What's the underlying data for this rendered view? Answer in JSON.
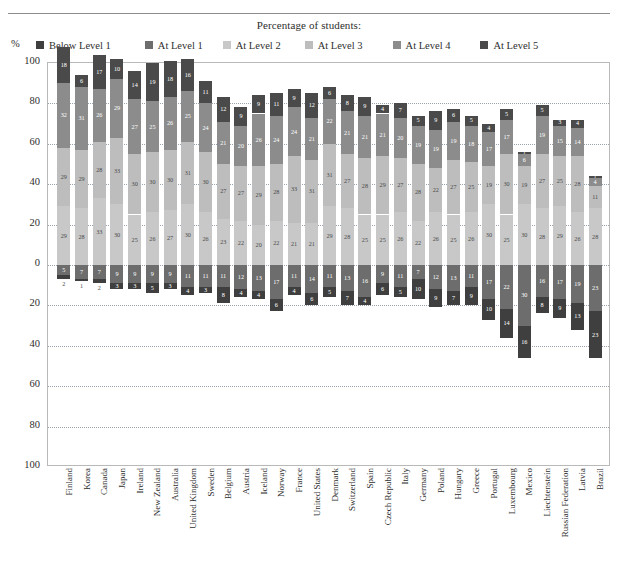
{
  "legend": {
    "title": "Percentage of students:",
    "axis_unit": "%",
    "items": [
      {
        "label": "Below Level 1",
        "color": "#3f3f3f"
      },
      {
        "label": "At Level 1",
        "color": "#6d6d6d"
      },
      {
        "label": "At Level 2",
        "color": "#c8c8c8"
      },
      {
        "label": "At Level 3",
        "color": "#bdbdbd"
      },
      {
        "label": "At Level 4",
        "color": "#8c8c8c"
      },
      {
        "label": "At Level 5",
        "color": "#4a4a4a"
      }
    ]
  },
  "yaxis": {
    "ticks_top": [
      "100",
      "80",
      "60",
      "40",
      "20",
      "0"
    ],
    "ticks_bottom": [
      "20",
      "40",
      "60",
      "80",
      "100"
    ],
    "all_ticks": [
      "100",
      "80",
      "60",
      "40",
      "20",
      "0",
      "20",
      "40",
      "60",
      "80",
      "100"
    ]
  },
  "chart_data": {
    "type": "bar",
    "subtype": "diverging-stacked-bar",
    "title": "Percentage of students:",
    "xlabel": "",
    "ylabel": "%",
    "ylim": [
      -100,
      100
    ],
    "grid": true,
    "legend_position": "top",
    "baseline_note": "Levels 2 and above plotted upward from the 0 line; Level 1 and Below Level 1 plotted downward.",
    "categories": [
      "Finland",
      "Korea",
      "Canada",
      "Japan",
      "Ireland",
      "New Zealand",
      "Australia",
      "United Kingdom",
      "Sweden",
      "Belgium",
      "Austria",
      "Iceland",
      "Norway",
      "France",
      "United States",
      "Denmark",
      "Switzerland",
      "Spain",
      "Czech Republic",
      "Italy",
      "Germany",
      "Poland",
      "Hungary",
      "Greece",
      "Portugal",
      "Luxembourg",
      "Mexico",
      "Liechtenstein",
      "Russian Federation",
      "Latvia",
      "Brazil"
    ],
    "series": [
      {
        "name": "At Level 5",
        "color": "#4a4a4a",
        "direction": "up",
        "values": [
          18,
          6,
          17,
          10,
          14,
          19,
          18,
          16,
          11,
          12,
          9,
          9,
          11,
          9,
          12,
          6,
          8,
          9,
          4,
          7,
          5,
          9,
          6,
          5,
          4,
          5,
          1,
          5,
          3,
          4,
          1
        ]
      },
      {
        "name": "At Level 4",
        "color": "#8c8c8c",
        "direction": "up",
        "values": [
          32,
          31,
          26,
          29,
          27,
          25,
          26,
          25,
          24,
          21,
          20,
          26,
          24,
          24,
          21,
          22,
          21,
          21,
          21,
          20,
          19,
          19,
          19,
          18,
          17,
          17,
          6,
          19,
          15,
          14,
          4
        ]
      },
      {
        "name": "At Level 3",
        "color": "#bdbdbd",
        "direction": "up",
        "values": [
          29,
          29,
          28,
          33,
          30,
          30,
          30,
          31,
          30,
          27,
          27,
          29,
          28,
          33,
          31,
          31,
          27,
          28,
          29,
          27,
          28,
          22,
          27,
          25,
          19,
          30,
          19,
          27,
          25,
          28,
          11
        ]
      },
      {
        "name": "At Level 2",
        "color": "#c8c8c8",
        "direction": "up",
        "values": [
          29,
          28,
          33,
          30,
          25,
          26,
          27,
          30,
          26,
          23,
          22,
          20,
          22,
          21,
          21,
          29,
          28,
          25,
          25,
          26,
          22,
          26,
          25,
          26,
          30,
          25,
          30,
          28,
          29,
          26,
          28
        ]
      },
      {
        "name": "At Level 1",
        "color": "#6d6d6d",
        "direction": "down",
        "values": [
          5,
          7,
          7,
          9,
          9,
          9,
          9,
          11,
          11,
          11,
          12,
          13,
          17,
          11,
          14,
          11,
          13,
          16,
          9,
          11,
          7,
          12,
          13,
          11,
          17,
          22,
          30,
          16,
          17,
          19,
          23
        ]
      },
      {
        "name": "Below Level 1",
        "color": "#3f3f3f",
        "direction": "down",
        "values": [
          2,
          1,
          2,
          3,
          3,
          5,
          3,
          4,
          3,
          8,
          4,
          4,
          6,
          4,
          6,
          5,
          7,
          4,
          6,
          5,
          10,
          9,
          7,
          9,
          10,
          14,
          16,
          8,
          9,
          13,
          23
        ]
      }
    ]
  }
}
